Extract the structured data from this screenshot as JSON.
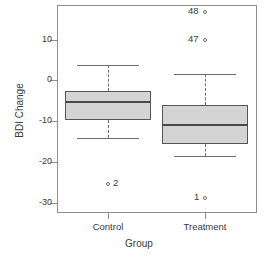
{
  "chart_data": {
    "type": "box",
    "title": "",
    "xlabel": "Group",
    "ylabel": "BDI Change",
    "ylim": [
      -32.5,
      18.5
    ],
    "yticks": [
      10,
      0,
      -10,
      -20,
      -30
    ],
    "ytick_labels": [
      "10",
      "0",
      "-10",
      "-20",
      "-30"
    ],
    "categories": [
      "Control",
      "Treatment"
    ],
    "grid": false,
    "legend": "none",
    "boxes": [
      {
        "category": "Control",
        "whisker_low": -14.0,
        "q1": -9.8,
        "median": -5.2,
        "q3": -2.5,
        "whisker_high": 3.7,
        "outliers": [
          {
            "label": "2",
            "value": -25.5,
            "label_side": "right"
          }
        ]
      },
      {
        "category": "Treatment",
        "whisker_low": -18.6,
        "q1": -15.7,
        "median": -11.0,
        "q3": -6.1,
        "whisker_high": 1.5,
        "outliers": [
          {
            "label": "48",
            "value": 16.7,
            "label_side": "left"
          },
          {
            "label": "47",
            "value": 10.0,
            "label_side": "left"
          },
          {
            "label": "1",
            "value": -28.7,
            "label_side": "left"
          }
        ]
      }
    ]
  },
  "axis": {
    "y_label": "BDI Change",
    "x_label": "Group",
    "y_tick_0": "10",
    "y_tick_1": "0",
    "y_tick_2": "-10",
    "y_tick_3": "-20",
    "y_tick_4": "-30",
    "x_tick_0": "Control",
    "x_tick_1": "Treatment"
  },
  "annotations": {
    "control_outlier_0": "2",
    "treatment_outlier_0": "48",
    "treatment_outlier_1": "47",
    "treatment_outlier_2": "1"
  },
  "colors": {
    "box_fill": "#d4d4d4",
    "box_stroke": "#555555",
    "median_stroke": "#4a4a4a",
    "whisker_stroke": "#6e6e6e",
    "frame_stroke": "#8e8e8e",
    "text": "#3a3a3a",
    "background": "#ffffff"
  }
}
